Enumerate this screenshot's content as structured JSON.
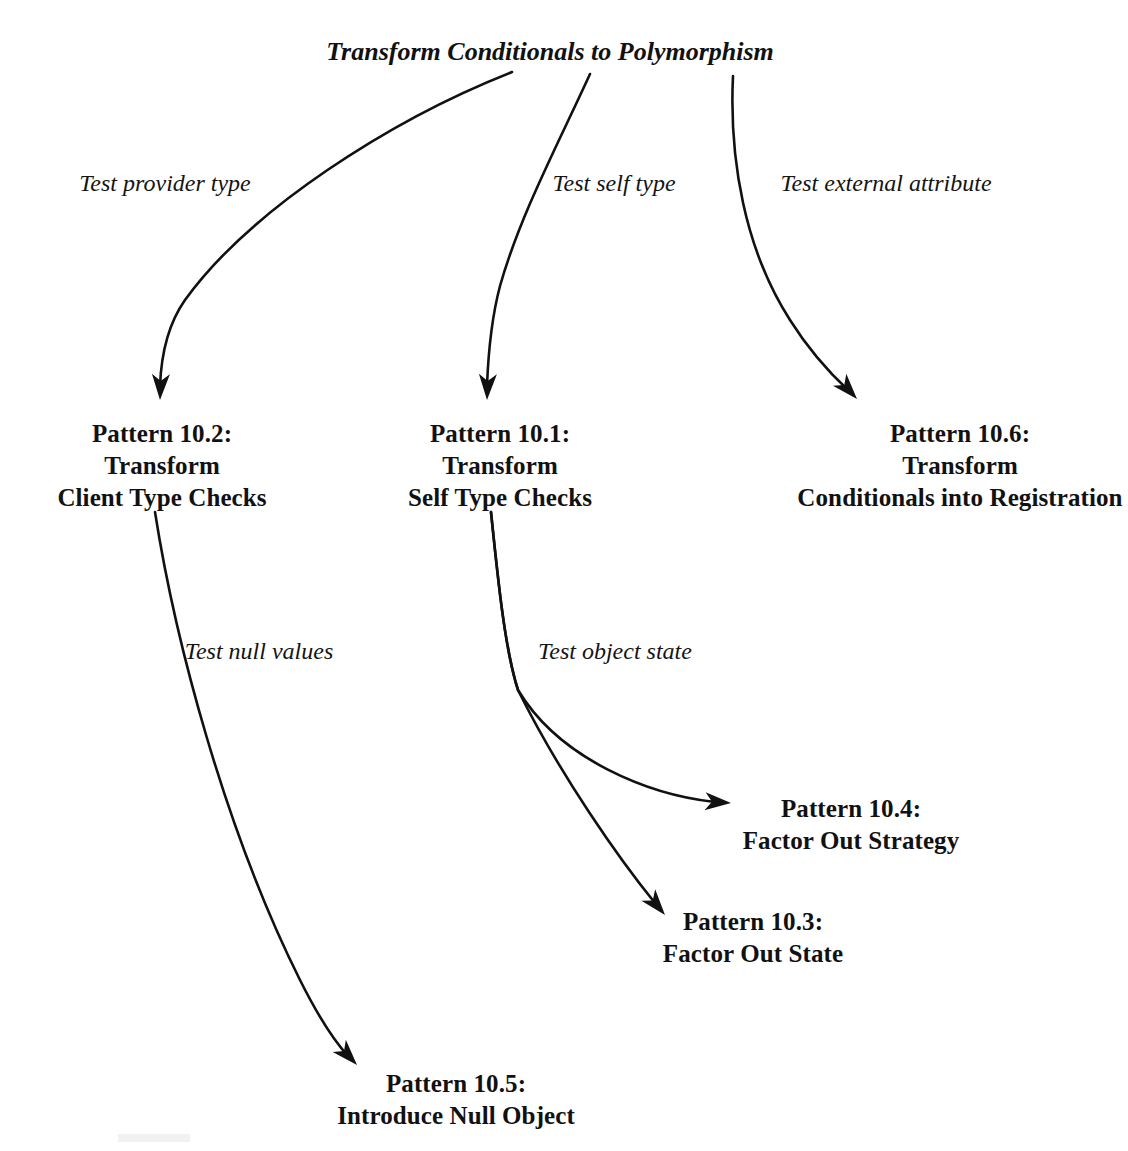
{
  "diagram": {
    "title": "Transform Conditionals to Polymorphism",
    "background_color": "#ffffff",
    "ink_color": "#111111",
    "root": {
      "id": "root",
      "label": "Transform Conditionals to Polymorphism",
      "x": 550,
      "y": 60
    },
    "nodes": [
      {
        "id": "pattern-10-2",
        "lines": [
          "Pattern 10.2:",
          "Transform",
          "Client Type Checks"
        ],
        "x": 162,
        "y": 418
      },
      {
        "id": "pattern-10-1",
        "lines": [
          "Pattern 10.1:",
          "Transform",
          "Self Type Checks"
        ],
        "x": 500,
        "y": 418
      },
      {
        "id": "pattern-10-6",
        "lines": [
          "Pattern 10.6:",
          "Transform",
          "Conditionals into Registration"
        ],
        "x": 960,
        "y": 418
      },
      {
        "id": "pattern-10-4",
        "lines": [
          "Pattern 10.4:",
          "Factor Out Strategy"
        ],
        "x": 851,
        "y": 793
      },
      {
        "id": "pattern-10-3",
        "lines": [
          "Pattern 10.3:",
          "Factor Out State"
        ],
        "x": 753,
        "y": 906
      },
      {
        "id": "pattern-10-5",
        "lines": [
          "Pattern 10.5:",
          "Introduce Null Object"
        ],
        "x": 456,
        "y": 1068
      }
    ],
    "edges": [
      {
        "id": "edge-test-provider-type",
        "from": "root",
        "to": "pattern-10-2",
        "label": "Test provider type",
        "label_x": 165,
        "label_y": 183,
        "path": "M 512 72 C 390 120 250 210 185 300 C 166 327 161 360 160 386",
        "arrow": {
          "x": 160,
          "y": 400,
          "angle": 92
        }
      },
      {
        "id": "edge-test-self-type",
        "from": "root",
        "to": "pattern-10-1",
        "label": "Test self type",
        "label_x": 614,
        "label_y": 183,
        "path": "M 590 74 C 560 140 520 215 500 286 C 491 320 488 360 487 386",
        "arrow": {
          "x": 487,
          "y": 400,
          "angle": 92
        }
      },
      {
        "id": "edge-test-external-attribute",
        "from": "root",
        "to": "pattern-10-6",
        "label": "Test external attribute",
        "label_x": 886,
        "label_y": 183,
        "path": "M 733 76 C 729 160 745 250 790 320 C 812 355 835 378 849 391",
        "arrow": {
          "x": 857,
          "y": 399,
          "angle": 48
        }
      },
      {
        "id": "edge-test-null-values",
        "from": "pattern-10-2",
        "to": "pattern-10-5",
        "label": "Test null values",
        "label_x": 259,
        "label_y": 651,
        "path": "M 155 512 C 175 640 225 830 300 980 C 320 1020 338 1045 348 1056",
        "arrow": {
          "x": 357,
          "y": 1065,
          "angle": 47
        }
      },
      {
        "id": "edge-test-object-state-strategy",
        "from": "pattern-10-1",
        "to": "pattern-10-4",
        "label": "Test object state",
        "label_x": 615,
        "label_y": 651,
        "path": "M 491 512 C 498 580 505 650 518 690 C 560 760 650 795 715 802",
        "arrow": {
          "x": 731,
          "y": 803,
          "angle": 4
        }
      },
      {
        "id": "edge-test-object-state-state",
        "from": "pattern-10-1",
        "to": "pattern-10-3",
        "label": "",
        "path": "M 491 512 C 498 580 505 650 518 690 C 560 775 620 860 655 903",
        "arrow": {
          "x": 665,
          "y": 915,
          "angle": 50
        }
      }
    ]
  }
}
